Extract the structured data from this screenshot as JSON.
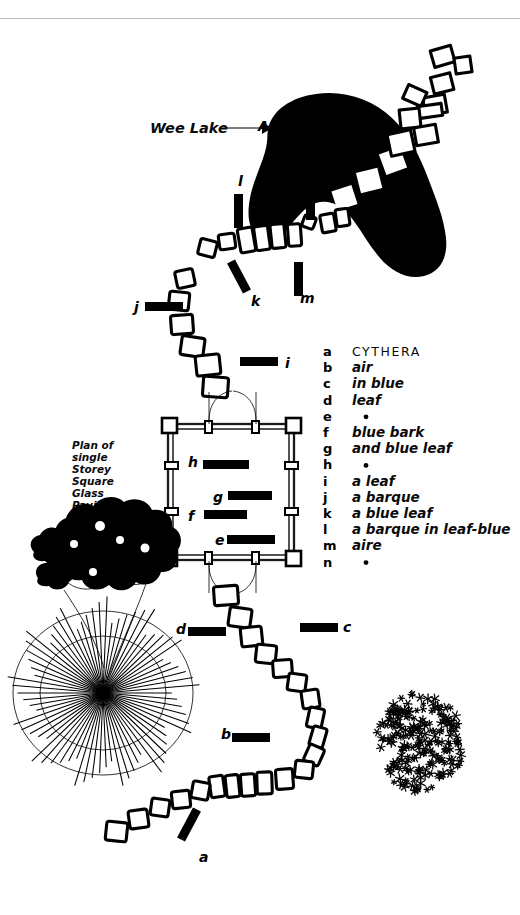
{
  "sheet": {
    "title": "CYTHERA",
    "background_color": "#ffffff",
    "ink_color": "#000000",
    "rule_color": "#b9b9b9"
  },
  "annotations": {
    "lake_label": "Wee Lake",
    "plan_note_lines": [
      "Plan of",
      "single",
      "Storey",
      "Square",
      "Glass",
      "Pavilion"
    ],
    "lake_point_marker": "A"
  },
  "legend": {
    "heading_letter": "a",
    "heading_text": "CYTHERA",
    "rows": [
      {
        "letter": "a",
        "text": "CYTHERA",
        "is_heading": true,
        "is_dot": false
      },
      {
        "letter": "b",
        "text": "air",
        "is_heading": false,
        "is_dot": false
      },
      {
        "letter": "c",
        "text": "in blue",
        "is_heading": false,
        "is_dot": false
      },
      {
        "letter": "d",
        "text": "leaf",
        "is_heading": false,
        "is_dot": false
      },
      {
        "letter": "e",
        "text": "•",
        "is_heading": false,
        "is_dot": true
      },
      {
        "letter": "f",
        "text": "blue bark",
        "is_heading": false,
        "is_dot": false
      },
      {
        "letter": "g",
        "text": "and blue leaf",
        "is_heading": false,
        "is_dot": false
      },
      {
        "letter": "h",
        "text": "•",
        "is_heading": false,
        "is_dot": true
      },
      {
        "letter": "i",
        "text": "a leaf",
        "is_heading": false,
        "is_dot": false
      },
      {
        "letter": "j",
        "text": "a barque",
        "is_heading": false,
        "is_dot": false
      },
      {
        "letter": "k",
        "text": "a blue leaf",
        "is_heading": false,
        "is_dot": false
      },
      {
        "letter": "l",
        "text": "a barque in leaf-blue",
        "is_heading": false,
        "is_dot": false
      },
      {
        "letter": "m",
        "text": "aire",
        "is_heading": false,
        "is_dot": false
      },
      {
        "letter": "n",
        "text": "•",
        "is_heading": false,
        "is_dot": true
      }
    ]
  },
  "site_markers": [
    {
      "id": "a",
      "label": "a",
      "label_x": 199,
      "label_y": 862,
      "bar_x": 172,
      "bar_y": 820,
      "bar_w": 34,
      "bar_h": 9,
      "bar_rot": -62
    },
    {
      "id": "b",
      "label": "b",
      "label_x": 221,
      "label_y": 739,
      "bar_x": 232,
      "bar_y": 733,
      "bar_w": 38,
      "bar_h": 9,
      "bar_rot": 0
    },
    {
      "id": "c",
      "label": "c",
      "label_x": 343,
      "label_y": 632,
      "bar_x": 300,
      "bar_y": 623,
      "bar_w": 38,
      "bar_h": 9,
      "bar_rot": 0
    },
    {
      "id": "d",
      "label": "d",
      "label_x": 176,
      "label_y": 634,
      "bar_x": 188,
      "bar_y": 627,
      "bar_w": 38,
      "bar_h": 9,
      "bar_rot": 0
    },
    {
      "id": "e",
      "label": "e",
      "label_x": 215,
      "label_y": 545,
      "bar_x": 227,
      "bar_y": 535,
      "bar_w": 48,
      "bar_h": 9,
      "bar_rot": 0
    },
    {
      "id": "f",
      "label": "f",
      "label_x": 188,
      "label_y": 521,
      "bar_x": 204,
      "bar_y": 510,
      "bar_w": 43,
      "bar_h": 9,
      "bar_rot": 0
    },
    {
      "id": "g",
      "label": "g",
      "label_x": 213,
      "label_y": 502,
      "bar_x": 228,
      "bar_y": 491,
      "bar_w": 44,
      "bar_h": 9,
      "bar_rot": 0
    },
    {
      "id": "h",
      "label": "h",
      "label_x": 188,
      "label_y": 467,
      "bar_x": 203,
      "bar_y": 460,
      "bar_w": 46,
      "bar_h": 9,
      "bar_rot": 0
    },
    {
      "id": "i",
      "label": "i",
      "label_x": 285,
      "label_y": 368,
      "bar_x": 240,
      "bar_y": 357,
      "bar_w": 38,
      "bar_h": 9,
      "bar_rot": 0
    },
    {
      "id": "j",
      "label": "j",
      "label_x": 134,
      "label_y": 312,
      "bar_x": 145,
      "bar_y": 302,
      "bar_w": 38,
      "bar_h": 9,
      "bar_rot": 0
    },
    {
      "id": "k",
      "label": "k",
      "label_x": 251,
      "label_y": 306,
      "bar_x": 222,
      "bar_y": 272,
      "bar_w": 34,
      "bar_h": 9,
      "bar_rot": 62
    },
    {
      "id": "l",
      "label": "l",
      "label_x": 238,
      "label_y": 186,
      "bar_x": 234,
      "bar_y": 194,
      "bar_w": 9,
      "bar_h": 34,
      "bar_rot": 0
    },
    {
      "id": "m",
      "label": "m",
      "label_x": 300,
      "label_y": 303,
      "bar_x": 294,
      "bar_y": 262,
      "bar_w": 9,
      "bar_h": 34,
      "bar_rot": 0
    },
    {
      "id": "n",
      "label": "n",
      "label_x": 292,
      "label_y": 198,
      "bar_x": 306,
      "bar_y": 186,
      "bar_w": 9,
      "bar_h": 34,
      "bar_rot": 0
    }
  ],
  "pavilion": {
    "name": "single storey square glass pavilion",
    "x": 166,
    "y": 422,
    "w": 130,
    "h": 140
  },
  "path_stones_upper": [
    {
      "x": 176,
      "y": 270,
      "w": 18,
      "h": 17,
      "r": -12
    },
    {
      "x": 169,
      "y": 292,
      "w": 20,
      "h": 18,
      "r": 6
    },
    {
      "x": 171,
      "y": 315,
      "w": 22,
      "h": 19,
      "r": -4
    },
    {
      "x": 181,
      "y": 337,
      "w": 23,
      "h": 19,
      "r": 8
    },
    {
      "x": 196,
      "y": 355,
      "w": 24,
      "h": 20,
      "r": -6
    },
    {
      "x": 203,
      "y": 377,
      "w": 25,
      "h": 20,
      "r": 4
    },
    {
      "x": 199,
      "y": 240,
      "w": 17,
      "h": 16,
      "r": 14
    },
    {
      "x": 219,
      "y": 234,
      "w": 16,
      "h": 15,
      "r": -8
    },
    {
      "x": 239,
      "y": 228,
      "w": 15,
      "h": 24,
      "r": -10
    },
    {
      "x": 255,
      "y": 226,
      "w": 14,
      "h": 24,
      "r": -8
    },
    {
      "x": 271,
      "y": 224,
      "w": 14,
      "h": 24,
      "r": -6
    },
    {
      "x": 288,
      "y": 224,
      "w": 13,
      "h": 22,
      "r": -4
    },
    {
      "x": 303,
      "y": 216,
      "w": 12,
      "h": 12,
      "r": 20
    },
    {
      "x": 321,
      "y": 214,
      "w": 14,
      "h": 18,
      "r": -10
    },
    {
      "x": 336,
      "y": 209,
      "w": 13,
      "h": 17,
      "r": -8
    }
  ],
  "path_stones_lower": [
    {
      "x": 214,
      "y": 586,
      "w": 24,
      "h": 19,
      "r": -4
    },
    {
      "x": 229,
      "y": 608,
      "w": 22,
      "h": 19,
      "r": 8
    },
    {
      "x": 241,
      "y": 627,
      "w": 21,
      "h": 19,
      "r": -6
    },
    {
      "x": 256,
      "y": 645,
      "w": 20,
      "h": 18,
      "r": 6
    },
    {
      "x": 273,
      "y": 660,
      "w": 19,
      "h": 17,
      "r": -4
    },
    {
      "x": 288,
      "y": 674,
      "w": 18,
      "h": 17,
      "r": 8
    },
    {
      "x": 302,
      "y": 690,
      "w": 17,
      "h": 18,
      "r": -8
    },
    {
      "x": 308,
      "y": 708,
      "w": 15,
      "h": 20,
      "r": 12
    },
    {
      "x": 311,
      "y": 727,
      "w": 14,
      "h": 20,
      "r": 16
    },
    {
      "x": 306,
      "y": 746,
      "w": 16,
      "h": 18,
      "r": 24
    },
    {
      "x": 295,
      "y": 761,
      "w": 18,
      "h": 17,
      "r": 6
    },
    {
      "x": 276,
      "y": 769,
      "w": 17,
      "h": 20,
      "r": -4
    },
    {
      "x": 257,
      "y": 772,
      "w": 15,
      "h": 22,
      "r": -2
    },
    {
      "x": 241,
      "y": 774,
      "w": 14,
      "h": 22,
      "r": -4
    },
    {
      "x": 226,
      "y": 775,
      "w": 13,
      "h": 22,
      "r": -6
    },
    {
      "x": 210,
      "y": 776,
      "w": 14,
      "h": 21,
      "r": -8
    },
    {
      "x": 192,
      "y": 782,
      "w": 17,
      "h": 17,
      "r": 10
    },
    {
      "x": 172,
      "y": 791,
      "w": 18,
      "h": 17,
      "r": -6
    },
    {
      "x": 151,
      "y": 799,
      "w": 18,
      "h": 17,
      "r": 8
    },
    {
      "x": 129,
      "y": 810,
      "w": 19,
      "h": 18,
      "r": -8
    },
    {
      "x": 106,
      "y": 822,
      "w": 21,
      "h": 19,
      "r": 6
    }
  ],
  "lake": {
    "name": "wee lake",
    "stepping_stone_count": 7
  },
  "vegetation": {
    "shrub_blob": {
      "name": "shrub-mass",
      "cx": 92,
      "cy": 565
    },
    "sunburst": {
      "name": "radiating-tree",
      "cx": 103,
      "cy": 693,
      "ray_count": 74,
      "radius": 93
    },
    "stipple_mass": {
      "name": "stipple-thicket",
      "cx": 424,
      "cy": 742
    }
  }
}
